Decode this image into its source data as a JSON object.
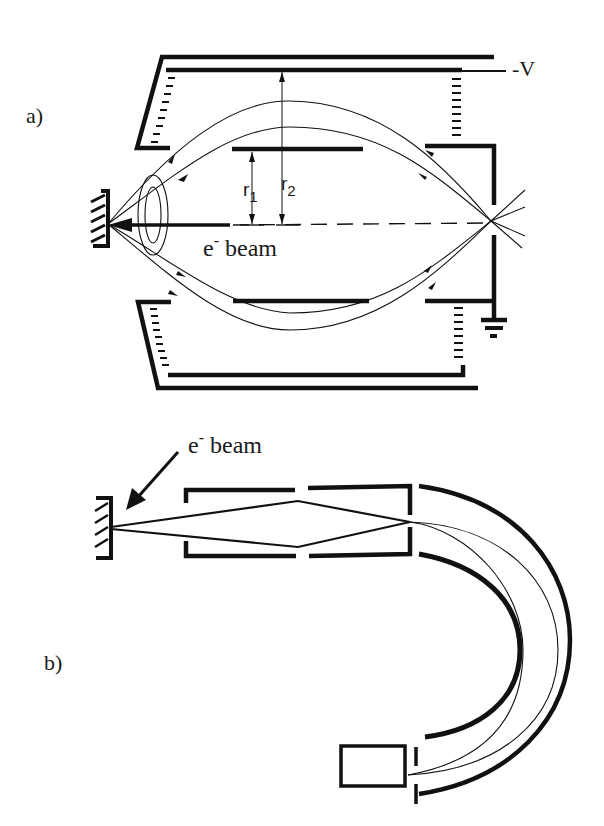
{
  "figure": {
    "panel_a": {
      "label": "a)",
      "voltage_label": "-V",
      "beam_label_e": "e",
      "beam_label_sup": "-",
      "beam_label_text": " beam",
      "radius_1_label": "r",
      "radius_1_sub": "1",
      "radius_2_label": "r",
      "radius_2_sub": "2",
      "components": [
        "outer-electrode",
        "inner-electrode",
        "middle-electrodes",
        "exit-aperture",
        "ground-symbol",
        "sample-target",
        "electron-trajectories",
        "optical-axis"
      ]
    },
    "panel_b": {
      "label": "b)",
      "beam_label_e": "e",
      "beam_label_sup": "-",
      "beam_label_text": " beam",
      "components": [
        "sample-target",
        "lens-box",
        "hemispherical-analyzer",
        "detector",
        "electron-trajectories"
      ]
    }
  }
}
